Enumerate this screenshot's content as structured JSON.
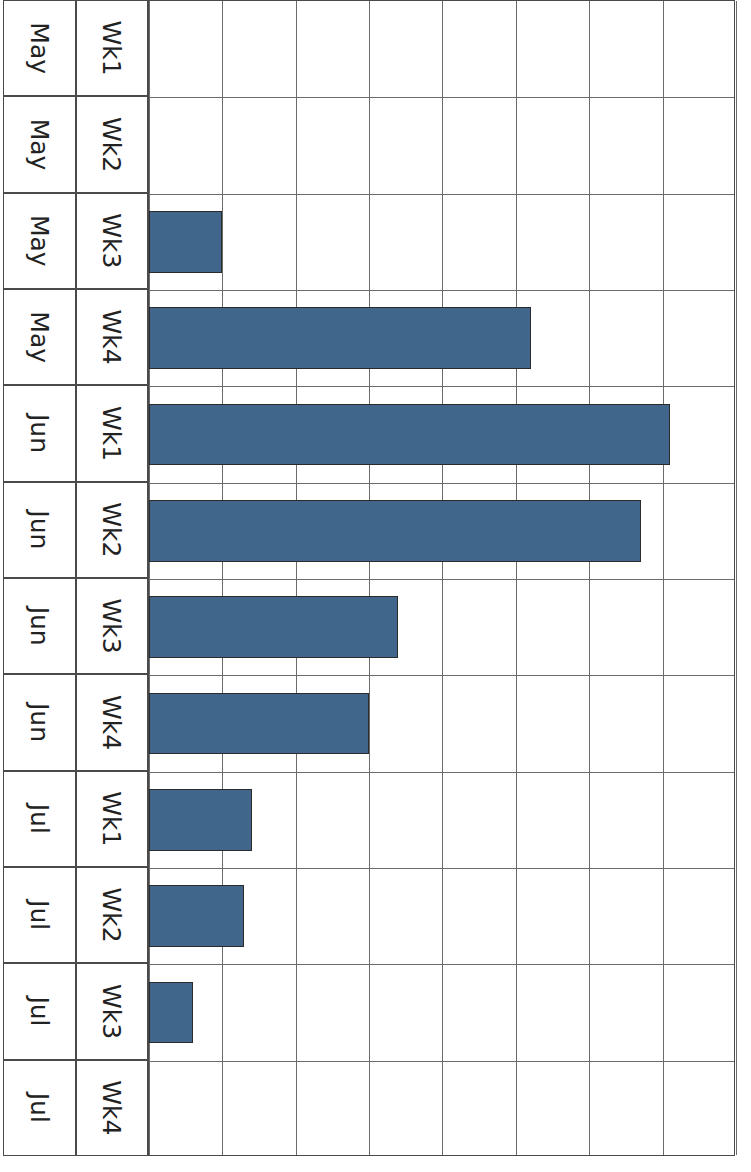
{
  "chart_data": {
    "type": "bar",
    "orientation": "vertical",
    "title": "",
    "subtitle": "",
    "xlabel": "",
    "ylabel": "",
    "ylim": [
      0,
      80
    ],
    "yticks": [
      0,
      10,
      20,
      30,
      40,
      50,
      60,
      70,
      80
    ],
    "grid": true,
    "legend": null,
    "series_color": "#41668C",
    "bar_border_color": "#2B2B2B",
    "categories": [
      "May Wk1",
      "May Wk2",
      "May Wk3",
      "May Wk4",
      "Jun Wk1",
      "Jun Wk2",
      "Jun Wk3",
      "Jun Wk4",
      "Jul Wk1",
      "Jul Wk2",
      "Jul Wk3",
      "Jul Wk4"
    ],
    "category_weeks": [
      "Wk1",
      "Wk2",
      "Wk3",
      "Wk4",
      "Wk1",
      "Wk2",
      "Wk3",
      "Wk4",
      "Wk1",
      "Wk2",
      "Wk3",
      "Wk4"
    ],
    "category_months": [
      "May",
      "May",
      "May",
      "May",
      "Jun",
      "Jun",
      "Jun",
      "Jun",
      "Jul",
      "Jul",
      "Jul",
      "Jul"
    ],
    "values": [
      0,
      0,
      10,
      52,
      71,
      67,
      34,
      30,
      14,
      13,
      6,
      0
    ]
  },
  "axis": {
    "tick_labels": [
      "0",
      "10",
      "20",
      "30",
      "40",
      "50",
      "60",
      "70",
      "80"
    ]
  }
}
